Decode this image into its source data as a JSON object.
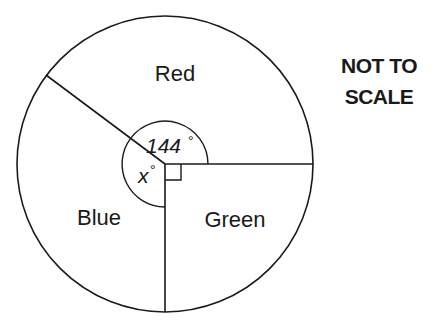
{
  "diagram": {
    "type": "pie-chart-angle-problem",
    "note_line1": "NOT TO",
    "note_line2": "SCALE",
    "sectors": [
      {
        "label": "Red",
        "angle_label": "144",
        "angle_deg": 144
      },
      {
        "label": "Blue",
        "angle_label": "x",
        "angle_deg": null
      },
      {
        "label": "Green",
        "angle_label": "",
        "angle_deg": 90,
        "right_angle_marker": true
      }
    ],
    "degree_symbol": "°",
    "colors": {
      "stroke": "#1a1a1a",
      "background": "#ffffff"
    }
  }
}
